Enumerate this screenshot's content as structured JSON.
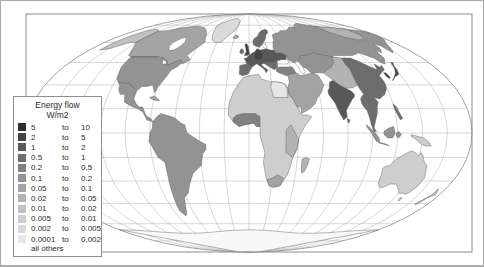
{
  "figure": {
    "background": "#ffffff",
    "border_color": "#ababab"
  },
  "map": {
    "ocean_color": "#ffffff",
    "graticule_color": "#b6b6b6",
    "coast_color": "#5f5f5f",
    "frame_color": "#8c8c8c",
    "no_data_color": "#f8f8f8"
  },
  "legend": {
    "title_line1": "Energy flow",
    "title_line2": "W/m2",
    "to_label": "to",
    "footer": "all others",
    "rows": [
      {
        "from": "5",
        "to": "10",
        "color": "#2d2d2d"
      },
      {
        "from": "2",
        "to": "5",
        "color": "#434343"
      },
      {
        "from": "1",
        "to": "2",
        "color": "#585858"
      },
      {
        "from": "0.5",
        "to": "1",
        "color": "#6d6d6d"
      },
      {
        "from": "0.2",
        "to": "0.5",
        "color": "#818181"
      },
      {
        "from": "0.1",
        "to": "0.2",
        "color": "#939393"
      },
      {
        "from": "0.05",
        "to": "0.1",
        "color": "#a3a3a3"
      },
      {
        "from": "0.02",
        "to": "0.05",
        "color": "#b3b3b3"
      },
      {
        "from": "0.01",
        "to": "0.02",
        "color": "#c1c1c1"
      },
      {
        "from": "0.005",
        "to": "0.01",
        "color": "#cecece"
      },
      {
        "from": "0.002",
        "to": "0.005",
        "color": "#dadada"
      },
      {
        "from": "0.0001",
        "to": "0.002",
        "color": "#e6e6e6"
      }
    ]
  }
}
